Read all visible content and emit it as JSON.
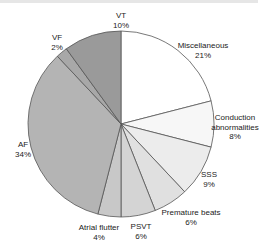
{
  "chart_data": {
    "type": "pie",
    "title": "",
    "start_angle": "12 o'clock, clockwise",
    "slices": [
      {
        "label": "Miscellaneous",
        "value": 21,
        "pct": "21%",
        "color": "#ffffff"
      },
      {
        "label": "Conduction abnormalities",
        "value": 8,
        "pct": "8%",
        "color": "#f7f7f7"
      },
      {
        "label": "SSS",
        "value": 9,
        "pct": "9%",
        "color": "#ececec"
      },
      {
        "label": "Premature beats",
        "value": 6,
        "pct": "6%",
        "color": "#e0e0e0"
      },
      {
        "label": "PSVT",
        "value": 6,
        "pct": "6%",
        "color": "#d4d4d4"
      },
      {
        "label": "Atrial flutter",
        "value": 4,
        "pct": "4%",
        "color": "#c8c8c8"
      },
      {
        "label": "AF",
        "value": 34,
        "pct": "34%",
        "color": "#b4b4b4"
      },
      {
        "label": "VF",
        "value": 2,
        "pct": "2%",
        "color": "#a8a8a8"
      },
      {
        "label": "VT",
        "value": 10,
        "pct": "10%",
        "color": "#9a9a9a"
      }
    ]
  },
  "labels": {
    "misc": {
      "name": "Miscellaneous",
      "pct": "21%"
    },
    "conduction": {
      "name1": "Conduction",
      "name2": "abnormalities",
      "pct": "8%"
    },
    "sss": {
      "name": "SSS",
      "pct": "9%"
    },
    "premature": {
      "name": "Premature beats",
      "pct": "6%"
    },
    "psvt": {
      "name": "PSVT",
      "pct": "6%"
    },
    "flutter": {
      "name": "Atrial flutter",
      "pct": "4%"
    },
    "af": {
      "name": "AF",
      "pct": "34%"
    },
    "vf": {
      "name": "VF",
      "pct": "2%"
    },
    "vt": {
      "name": "VT",
      "pct": "10%"
    }
  }
}
